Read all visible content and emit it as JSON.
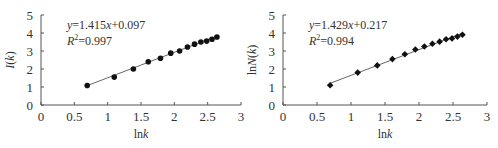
{
  "chart_data": [
    {
      "type": "scatter",
      "title": "",
      "xlabel": "lnk",
      "ylabel": "I(k)",
      "xlim": [
        0,
        3
      ],
      "ylim": [
        0,
        5
      ],
      "xticks": [
        "0",
        "0.5",
        "1",
        "1.5",
        "2",
        "2.5",
        "3"
      ],
      "yticks": [
        "0",
        "1",
        "2",
        "3",
        "4",
        "5"
      ],
      "grid": false,
      "marker": "circle",
      "annotations": [
        "y=1.415x+0.097",
        "R2=0.997"
      ],
      "fit": {
        "slope": 1.415,
        "intercept": 0.097,
        "r2": 0.997
      },
      "x": [
        0.693,
        1.099,
        1.386,
        1.609,
        1.792,
        1.946,
        2.079,
        2.197,
        2.303,
        2.398,
        2.485,
        2.565,
        2.639
      ],
      "y": [
        1.08,
        1.55,
        2.0,
        2.4,
        2.6,
        2.88,
        3.0,
        3.22,
        3.38,
        3.5,
        3.55,
        3.65,
        3.78
      ]
    },
    {
      "type": "scatter",
      "title": "",
      "xlabel": "lnk",
      "ylabel": "lnN(k)",
      "xlim": [
        0,
        3
      ],
      "ylim": [
        0,
        5
      ],
      "xticks": [
        "0",
        "0.5",
        "1",
        "1.5",
        "2",
        "2.5",
        "3"
      ],
      "yticks": [
        "0",
        "1",
        "2",
        "3",
        "4",
        "5"
      ],
      "grid": false,
      "marker": "diamond",
      "annotations": [
        "y=1.429x+0.217",
        "R2=0.994"
      ],
      "fit": {
        "slope": 1.429,
        "intercept": 0.217,
        "r2": 0.994
      },
      "x": [
        0.693,
        1.099,
        1.386,
        1.609,
        1.792,
        1.946,
        2.079,
        2.197,
        2.303,
        2.398,
        2.485,
        2.565,
        2.639
      ],
      "y": [
        1.1,
        1.8,
        2.2,
        2.55,
        2.82,
        3.08,
        3.25,
        3.4,
        3.52,
        3.65,
        3.7,
        3.8,
        3.9
      ]
    }
  ],
  "charts": [
    {
      "eq_prefix": "y",
      "eq_body": "=1.415",
      "eq_x": "x",
      "eq_tail": "+0.097",
      "r2_label": "R",
      "r2_sup": "2",
      "r2_value": "=0.997",
      "ylabel_main": "I",
      "ylabel_paren": "(k)",
      "xlabel_ln": "ln",
      "xlabel_k": "k"
    },
    {
      "eq_prefix": "y",
      "eq_body": "=1.429",
      "eq_x": "x",
      "eq_tail": "+0.217",
      "r2_label": "R",
      "r2_sup": "2",
      "r2_value": "=0.994",
      "ylabel_ln": "ln",
      "ylabel_main": "N",
      "ylabel_paren": "(k)",
      "xlabel_ln": "ln",
      "xlabel_k": "k"
    }
  ]
}
